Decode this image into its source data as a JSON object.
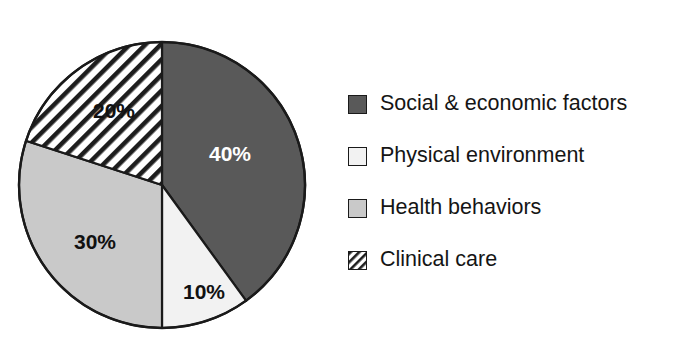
{
  "chart_data": {
    "type": "pie",
    "title": "",
    "subtitle": "",
    "xlabel": "",
    "ylabel": "",
    "legend_position": "right",
    "grid": false,
    "start_angle_deg": 0,
    "direction": "clockwise",
    "categories": [
      "Social & economic factors",
      "Physical environment",
      "Health behaviors",
      "Clinical care"
    ],
    "values": [
      40,
      10,
      30,
      20
    ],
    "value_labels": [
      "40%",
      "10%",
      "30%",
      "20%"
    ],
    "units": "percent",
    "slices": [
      {
        "label": "Social & economic factors",
        "value": 40,
        "value_label": "40%",
        "start_deg": 0,
        "end_deg": 144,
        "fill": "#595959",
        "pattern": "solid",
        "label_color": "#ffffff",
        "label_x": 230,
        "label_y": 155
      },
      {
        "label": "Physical environment",
        "value": 10,
        "value_label": "10%",
        "start_deg": 144,
        "end_deg": 180,
        "fill": "#f2f2f2",
        "pattern": "solid",
        "label_color": "#111111",
        "label_y": 293,
        "label_x": 204
      },
      {
        "label": "Health behaviors",
        "value": 30,
        "value_label": "30%",
        "start_deg": 180,
        "end_deg": 288,
        "fill": "#c9c9c9",
        "pattern": "solid",
        "label_color": "#111111",
        "label_x": 95,
        "label_y": 243
      },
      {
        "label": "Clinical care",
        "value": 20,
        "value_label": "20%",
        "start_deg": 288,
        "end_deg": 360,
        "fill": "#ffffff",
        "pattern": "diagonal-hatch",
        "label_color": "#111111",
        "label_x": 114,
        "label_y": 112
      }
    ]
  },
  "pie": {
    "center_x": 162,
    "center_y": 185,
    "radius": 143,
    "outline_color": "#1a1a1a"
  },
  "legend": {
    "items": [
      {
        "label": "Social & economic factors",
        "swatch_name": "legend-swatch-social-economic-factors",
        "fill": "#595959",
        "pattern": "solid"
      },
      {
        "label": "Physical environment",
        "swatch_name": "legend-swatch-physical-environment",
        "fill": "#f2f2f2",
        "pattern": "solid"
      },
      {
        "label": "Health behaviors",
        "swatch_name": "legend-swatch-health-behaviors",
        "fill": "#c9c9c9",
        "pattern": "solid"
      },
      {
        "label": "Clinical care",
        "swatch_name": "legend-swatch-clinical-care",
        "fill": "#ffffff",
        "pattern": "diagonal-hatch"
      }
    ]
  }
}
